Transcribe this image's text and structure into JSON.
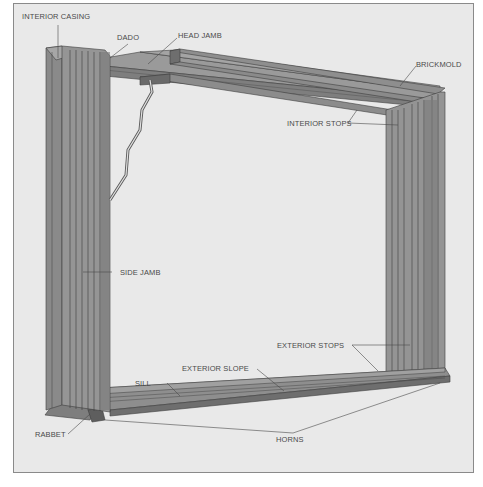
{
  "diagram": {
    "colors": {
      "background": "#e9e9e9",
      "border": "#8a8a8a",
      "wood_light": "#9a9a9a",
      "wood_mid": "#8a8a8a",
      "wood_dark": "#6e6e6e",
      "line": "#3e3e3e",
      "label_text": "#4a4a4a"
    },
    "labels": {
      "interior_casing": "INTERIOR CASING",
      "dado": "DADO",
      "head_jamb": "HEAD JAMB",
      "brickmold": "BRICKMOLD",
      "interior_stops": "INTERIOR STOPS",
      "side_jamb": "SIDE JAMB",
      "exterior_stops": "EXTERIOR STOPS",
      "exterior_slope": "EXTERIOR SLOPE",
      "sill": "SILL",
      "rabbet": "RABBET",
      "horns": "HORNS"
    }
  }
}
